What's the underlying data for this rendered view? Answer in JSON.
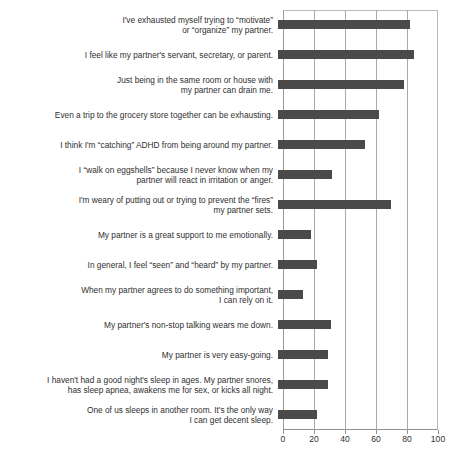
{
  "chart_data": {
    "type": "bar",
    "orientation": "horizontal",
    "title": "",
    "xlabel": "",
    "ylabel": "",
    "xlim": [
      0,
      100
    ],
    "xticks": [
      0,
      20,
      40,
      60,
      80,
      100
    ],
    "grid": true,
    "legend": "none",
    "bar_color": "#4a4a4a",
    "categories": [
      "I've exhausted myself trying to “motivate”\nor “organize” my partner.",
      "I feel like my partner's servant, secretary, or parent.",
      "Just being in the same room or house with\nmy partner can drain me.",
      "Even a trip to the grocery store together can be exhausting.",
      "I think I'm “catching” ADHD from being around my partner.",
      "I “walk on eggshells” because I never know when my\npartner will react in irritation or anger.",
      "I'm weary of putting out or trying to prevent the “fires”\nmy partner sets.",
      "My partner is a great support to me emotionally.",
      "In general, I feel “seen” and “heard” by my partner.",
      "When my partner agrees to do something important,\nI can rely on it.",
      "My partner's non-stop talking wears me down.",
      "My partner is very easy-going.",
      "I haven't had a good night's sleep in ages. My partner snores,\nhas sleep apnea, awakens me for sex, or kicks all night.",
      "One of us sleeps in another room. It's the only way\nI can get decent sleep."
    ],
    "values": [
      85,
      88,
      81,
      65,
      56,
      35,
      73,
      21,
      25,
      16,
      34,
      32,
      32,
      25
    ]
  }
}
